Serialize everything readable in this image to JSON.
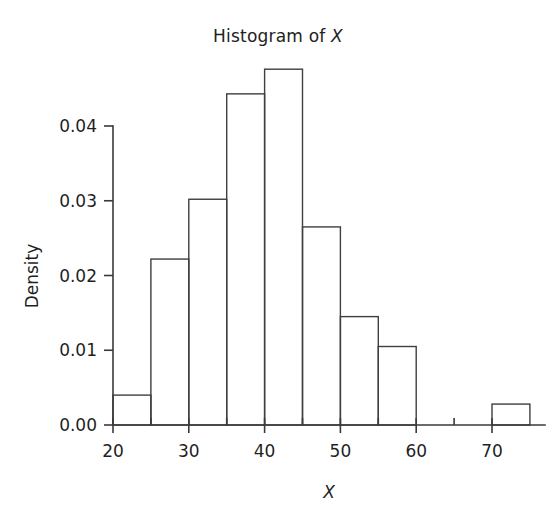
{
  "figure": {
    "width": 556,
    "height": 520,
    "background": "#ffffff",
    "ink_color": "#3a3a3a"
  },
  "title": {
    "prefix": "Histogram of ",
    "variable": "X"
  },
  "axes": {
    "x": {
      "label": "X",
      "tick_labels": [
        "20",
        "30",
        "40",
        "50",
        "60",
        "70"
      ],
      "tick_values": [
        20,
        30,
        40,
        50,
        60,
        70
      ],
      "minor_tick_values": [
        25,
        35,
        45,
        55,
        65
      ],
      "range": [
        20,
        75
      ]
    },
    "y": {
      "label": "Density",
      "tick_labels": [
        "0.00",
        "0.01",
        "0.02",
        "0.03",
        "0.04"
      ],
      "tick_values": [
        0.0,
        0.01,
        0.02,
        0.03,
        0.04
      ],
      "range": [
        0.0,
        0.0476
      ]
    }
  },
  "chart_data": {
    "type": "bar",
    "title": "Histogram of X",
    "xlabel": "X",
    "ylabel": "Density",
    "xlim": [
      20,
      75
    ],
    "ylim": [
      0,
      0.0476
    ],
    "grid": false,
    "legend": "none",
    "bin_width": 5,
    "bin_edges": [
      20,
      25,
      30,
      35,
      40,
      45,
      50,
      55,
      60,
      65,
      70,
      75
    ],
    "categories": [
      "20-25",
      "25-30",
      "30-35",
      "35-40",
      "40-45",
      "45-50",
      "50-55",
      "55-60",
      "60-65",
      "65-70",
      "70-75"
    ],
    "values": [
      0.004,
      0.0222,
      0.0302,
      0.0443,
      0.0476,
      0.0265,
      0.0145,
      0.0105,
      0.0,
      0.0,
      0.0028
    ]
  },
  "geometry": {
    "x_axis_y": 425,
    "y_axis_x": 113,
    "x_at_20": 113,
    "px_per_x_unit": 7.58,
    "y_at_0": 425,
    "px_per_density_unit": 7475
  }
}
